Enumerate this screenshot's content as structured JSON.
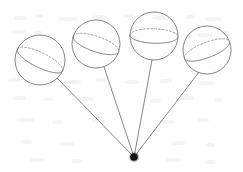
{
  "figure": {
    "caption": "",
    "background_color": "#fefefe",
    "stroke_color": "#6f6f72",
    "dashed_stroke_color": "#8d8d90",
    "vertex_color": "#141414",
    "canvas": {
      "width": 243,
      "height": 172
    }
  },
  "vertex": {
    "label": "",
    "x": 134,
    "y": 157,
    "radius": 3.6
  },
  "spheres": [
    {
      "id": "sphere-1",
      "label": "",
      "cx": 40,
      "cy": 60,
      "r": 25,
      "circle_tilt_deg": 26,
      "circle_ry_ratio": 0.3,
      "attach_x": 57,
      "attach_y": 78
    },
    {
      "id": "sphere-2",
      "label": "",
      "cx": 96,
      "cy": 44,
      "r": 24,
      "circle_tilt_deg": 19,
      "circle_ry_ratio": 0.32,
      "attach_x": 104,
      "attach_y": 67
    },
    {
      "id": "sphere-3",
      "label": "",
      "cx": 154,
      "cy": 36,
      "r": 24,
      "circle_tilt_deg": 2,
      "circle_ry_ratio": 0.3,
      "attach_x": 152,
      "attach_y": 60
    },
    {
      "id": "sphere-4",
      "label": "",
      "cx": 207,
      "cy": 50,
      "r": 24,
      "circle_tilt_deg": -21,
      "circle_ry_ratio": 0.32,
      "attach_x": 199,
      "attach_y": 72
    }
  ],
  "rays": [
    {
      "id": "ray-1",
      "from": "vertex",
      "to": "sphere-1"
    },
    {
      "id": "ray-2",
      "from": "vertex",
      "to": "sphere-2"
    },
    {
      "id": "ray-3",
      "from": "vertex",
      "to": "sphere-3"
    },
    {
      "id": "ray-4",
      "from": "vertex",
      "to": "sphere-4"
    }
  ],
  "specks": [
    {
      "x": 14,
      "y": 16,
      "w": 13,
      "h": 4
    },
    {
      "x": 36,
      "y": 14,
      "w": 7,
      "h": 4
    },
    {
      "x": 58,
      "y": 17,
      "w": 20,
      "h": 4
    },
    {
      "x": 92,
      "y": 15,
      "w": 15,
      "h": 4
    },
    {
      "x": 124,
      "y": 14,
      "w": 11,
      "h": 4
    },
    {
      "x": 152,
      "y": 16,
      "w": 18,
      "h": 4
    },
    {
      "x": 186,
      "y": 15,
      "w": 9,
      "h": 4
    },
    {
      "x": 206,
      "y": 17,
      "w": 16,
      "h": 4
    },
    {
      "x": 10,
      "y": 30,
      "w": 16,
      "h": 4
    },
    {
      "x": 34,
      "y": 31,
      "w": 8,
      "h": 3
    },
    {
      "x": 198,
      "y": 33,
      "w": 14,
      "h": 4
    },
    {
      "x": 220,
      "y": 31,
      "w": 9,
      "h": 4
    },
    {
      "x": 8,
      "y": 78,
      "w": 12,
      "h": 4
    },
    {
      "x": 64,
      "y": 80,
      "w": 17,
      "h": 4
    },
    {
      "x": 96,
      "y": 78,
      "w": 10,
      "h": 4
    },
    {
      "x": 124,
      "y": 80,
      "w": 15,
      "h": 4
    },
    {
      "x": 160,
      "y": 79,
      "w": 12,
      "h": 4
    },
    {
      "x": 196,
      "y": 81,
      "w": 19,
      "h": 4
    },
    {
      "x": 12,
      "y": 96,
      "w": 14,
      "h": 4
    },
    {
      "x": 44,
      "y": 98,
      "w": 9,
      "h": 3
    },
    {
      "x": 78,
      "y": 97,
      "w": 16,
      "h": 4
    },
    {
      "x": 150,
      "y": 99,
      "w": 11,
      "h": 4
    },
    {
      "x": 180,
      "y": 96,
      "w": 14,
      "h": 4
    },
    {
      "x": 214,
      "y": 98,
      "w": 8,
      "h": 4
    },
    {
      "x": 16,
      "y": 118,
      "w": 18,
      "h": 4
    },
    {
      "x": 52,
      "y": 120,
      "w": 10,
      "h": 4
    },
    {
      "x": 92,
      "y": 119,
      "w": 13,
      "h": 4
    },
    {
      "x": 160,
      "y": 120,
      "w": 15,
      "h": 4
    },
    {
      "x": 198,
      "y": 118,
      "w": 11,
      "h": 4
    },
    {
      "x": 20,
      "y": 140,
      "w": 12,
      "h": 4
    },
    {
      "x": 58,
      "y": 142,
      "w": 16,
      "h": 4
    },
    {
      "x": 172,
      "y": 141,
      "w": 13,
      "h": 4
    },
    {
      "x": 206,
      "y": 143,
      "w": 9,
      "h": 4
    },
    {
      "x": 30,
      "y": 158,
      "w": 15,
      "h": 4
    },
    {
      "x": 72,
      "y": 159,
      "w": 10,
      "h": 4
    },
    {
      "x": 166,
      "y": 158,
      "w": 17,
      "h": 4
    },
    {
      "x": 204,
      "y": 160,
      "w": 12,
      "h": 4
    }
  ]
}
